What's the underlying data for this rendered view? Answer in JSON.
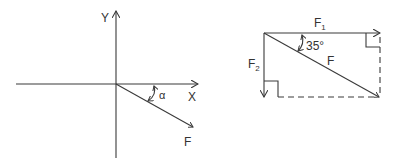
{
  "left_diagram": {
    "y_axis_label": "Y",
    "x_axis_label": "X",
    "angle_label": "α",
    "force_label": "F"
  },
  "right_diagram": {
    "f1_label": "F",
    "f1_sub": "1",
    "f2_label": "F",
    "f2_sub": "2",
    "resultant_label": "F",
    "angle_label": "35°"
  },
  "colors": {
    "stroke": "#3a3a3a",
    "background": "#ffffff"
  }
}
